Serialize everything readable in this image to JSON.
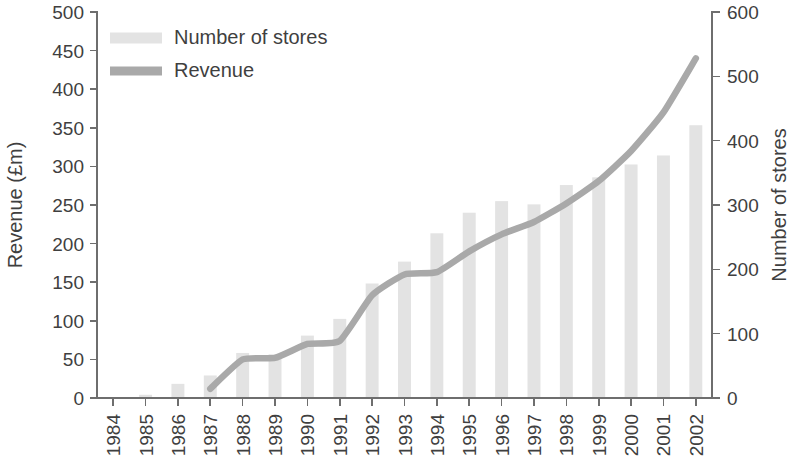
{
  "chart_data": {
    "type": "bar",
    "title": "",
    "xlabel": "",
    "categories": [
      "1984",
      "1985",
      "1986",
      "1987",
      "1988",
      "1989",
      "1990",
      "1991",
      "1992",
      "1993",
      "1994",
      "1995",
      "1996",
      "1997",
      "1998",
      "1999",
      "2000",
      "2001",
      "2002"
    ],
    "grid": false,
    "legend_position": "top-left",
    "series": [
      {
        "name": "Number of stores",
        "type": "bar",
        "axis": "right",
        "ylabel": "Number of stores",
        "ylim": [
          0,
          600
        ],
        "yticks": [
          0,
          100,
          200,
          300,
          400,
          500,
          600
        ],
        "color": "#e3e3e3",
        "values": [
          0,
          5,
          22,
          35,
          70,
          68,
          97,
          123,
          178,
          212,
          256,
          288,
          306,
          301,
          331,
          343,
          363,
          377,
          424
        ]
      },
      {
        "name": "Revenue",
        "type": "line",
        "axis": "left",
        "ylabel": "Revenue (£m)",
        "ylim": [
          0,
          500
        ],
        "yticks": [
          0,
          50,
          100,
          150,
          200,
          250,
          300,
          350,
          400,
          450,
          500
        ],
        "color": "#a9a9a9",
        "values": [
          null,
          null,
          null,
          12,
          50,
          52,
          70,
          74,
          133,
          160,
          163,
          190,
          212,
          228,
          252,
          281,
          320,
          370,
          440
        ]
      }
    ]
  },
  "axes": {
    "left": {
      "title": "Revenue (£m)",
      "ticks": [
        "500",
        "450",
        "400",
        "350",
        "300",
        "250",
        "200",
        "150",
        "100",
        "50",
        "0"
      ]
    },
    "right": {
      "title": "Number of stores",
      "ticks": [
        "600",
        "500",
        "400",
        "300",
        "200",
        "100",
        "0"
      ]
    },
    "bottom": {
      "ticks": [
        "1984",
        "1985",
        "1986",
        "1987",
        "1988",
        "1989",
        "1990",
        "1991",
        "1992",
        "1993",
        "1994",
        "1995",
        "1996",
        "1997",
        "1998",
        "1999",
        "2000",
        "2001",
        "2002"
      ]
    }
  },
  "legend": {
    "items": [
      {
        "label": "Number of stores",
        "swatch": "#e3e3e3",
        "shape": "bar-swatch"
      },
      {
        "label": "Revenue",
        "swatch": "#a9a9a9",
        "shape": "line-swatch"
      }
    ]
  }
}
